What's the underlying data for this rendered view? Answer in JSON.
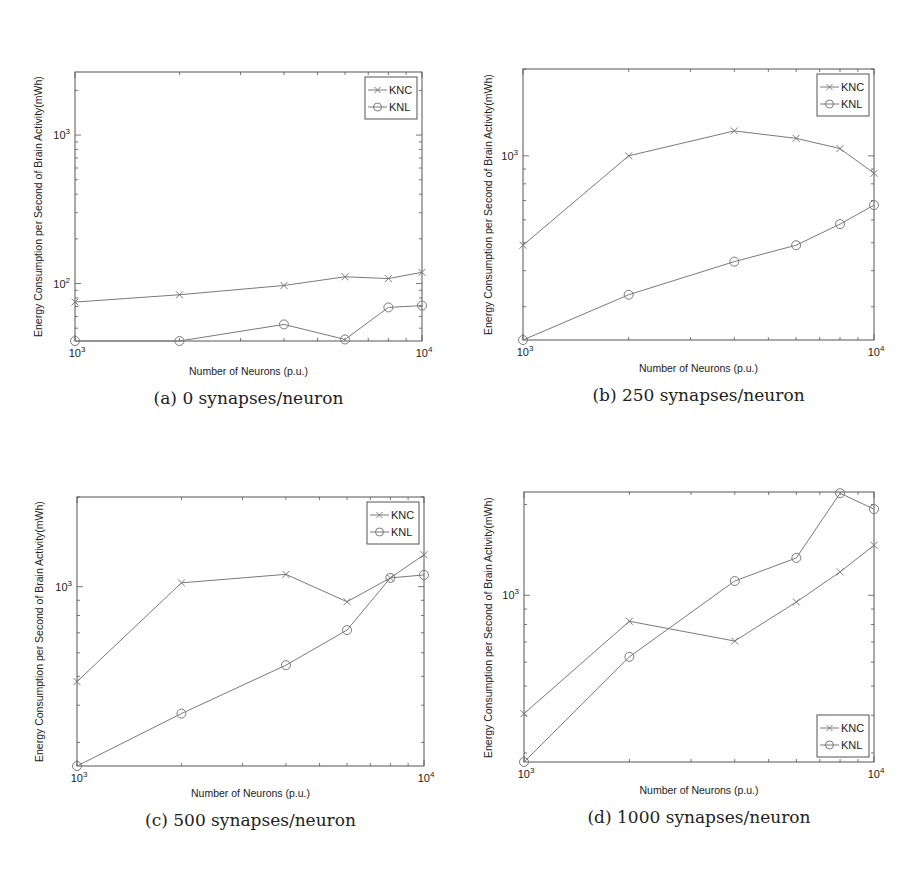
{
  "figure": {
    "xlabel": "Number of Neurons (p.u.)",
    "ylabel": "Energy Consumption per Second of Brain Activity(mWh)",
    "series_names": [
      "KNC",
      "KNL"
    ],
    "line_color": "#7a7a7a",
    "axis_color": "#555555"
  },
  "panels": [
    {
      "id": "a",
      "caption": "(a) 0 synapses/neuron"
    },
    {
      "id": "b",
      "caption": "(b) 250 synapses/neuron"
    },
    {
      "id": "c",
      "caption": "(c) 500 synapses/neuron"
    },
    {
      "id": "d",
      "caption": "(d) 1000 synapses/neuron"
    }
  ],
  "chart_data": [
    {
      "type": "line",
      "title": "(a) 0 synapses/neuron",
      "xlabel": "Number of Neurons (p.u.)",
      "ylabel": "Energy Consumption per Second of Brain Activity(mWh)",
      "xscale": "log",
      "yscale": "log",
      "x": [
        1000,
        2000,
        4000,
        6000,
        8000,
        10000
      ],
      "xlim": [
        1000,
        10000
      ],
      "ylim": [
        41,
        2660
      ],
      "xticks": [
        "10^3",
        "10^4"
      ],
      "yticks": [
        "10^2",
        "10^3"
      ],
      "legend_position": "upper right",
      "grid": false,
      "series": [
        {
          "name": "KNC",
          "marker": "x",
          "values": [
            75,
            84,
            97,
            111,
            108,
            119
          ]
        },
        {
          "name": "KNL",
          "marker": "o",
          "values": [
            41,
            41,
            53,
            42,
            69,
            71
          ]
        }
      ]
    },
    {
      "type": "line",
      "title": "(b) 250 synapses/neuron",
      "xlabel": "Number of Neurons (p.u.)",
      "ylabel": "Energy Consumption per Second of Brain Activity(mWh)",
      "xscale": "log",
      "yscale": "log",
      "x": [
        1000,
        2000,
        4000,
        6000,
        8000,
        10000
      ],
      "xlim": [
        1000,
        10000
      ],
      "ylim": [
        230,
        2000
      ],
      "xticks": [
        "10^3",
        "10^4"
      ],
      "yticks": [
        "10^3"
      ],
      "legend_position": "upper right",
      "grid": false,
      "series": [
        {
          "name": "KNC",
          "marker": "x",
          "values": [
            490,
            1000,
            1220,
            1150,
            1060,
            870
          ]
        },
        {
          "name": "KNL",
          "marker": "o",
          "values": [
            230,
            330,
            430,
            490,
            580,
            675
          ]
        }
      ]
    },
    {
      "type": "line",
      "title": "(c) 500 synapses/neuron",
      "xlabel": "Number of Neurons (p.u.)",
      "ylabel": "Energy Consumption per Second of Brain Activity(mWh)",
      "xscale": "log",
      "yscale": "log",
      "x": [
        1000,
        2000,
        4000,
        6000,
        8000,
        10000
      ],
      "xlim": [
        1000,
        10000
      ],
      "ylim": [
        250,
        2000
      ],
      "xticks": [
        "10^3",
        "10^4"
      ],
      "yticks": [
        "10^3"
      ],
      "legend_position": "upper right",
      "grid": false,
      "series": [
        {
          "name": "KNC",
          "marker": "x",
          "values": [
            480,
            1030,
            1100,
            890,
            1070,
            1280
          ]
        },
        {
          "name": "KNL",
          "marker": "o",
          "values": [
            250,
            375,
            545,
            715,
            1070,
            1095
          ]
        }
      ]
    },
    {
      "type": "line",
      "title": "(d) 1000 synapses/neuron",
      "xlabel": "Number of Neurons (p.u.)",
      "ylabel": "Energy Consumption per Second of Brain Activity(mWh)",
      "xscale": "log",
      "yscale": "log",
      "x": [
        1000,
        2000,
        4000,
        6000,
        8000,
        10000
      ],
      "xlim": [
        1000,
        10000
      ],
      "ylim": [
        280,
        2200
      ],
      "xticks": [
        "10^3",
        "10^4"
      ],
      "yticks": [
        "10^3"
      ],
      "legend_position": "lower right",
      "grid": false,
      "series": [
        {
          "name": "KNC",
          "marker": "x",
          "values": [
            405,
            820,
            705,
            950,
            1195,
            1465
          ]
        },
        {
          "name": "KNL",
          "marker": "o",
          "values": [
            280,
            625,
            1115,
            1330,
            2180,
            1930
          ]
        }
      ]
    }
  ],
  "layout": [
    {
      "box": [
        75,
        72,
        422,
        341
      ],
      "ylabel_x": 32,
      "xlabel_y": 371,
      "caption_y": 394,
      "legend": "ur"
    },
    {
      "box": [
        523,
        69,
        874,
        340
      ],
      "ylabel_x": 482,
      "xlabel_y": 368,
      "caption_y": 391,
      "legend": "ur"
    },
    {
      "box": [
        77,
        497,
        424,
        766
      ],
      "ylabel_x": 33,
      "xlabel_y": 793,
      "caption_y": 816,
      "legend": "ur"
    },
    {
      "box": [
        524,
        492,
        874,
        762
      ],
      "ylabel_x": 482,
      "xlabel_y": 790,
      "caption_y": 813,
      "legend": "lr"
    }
  ]
}
